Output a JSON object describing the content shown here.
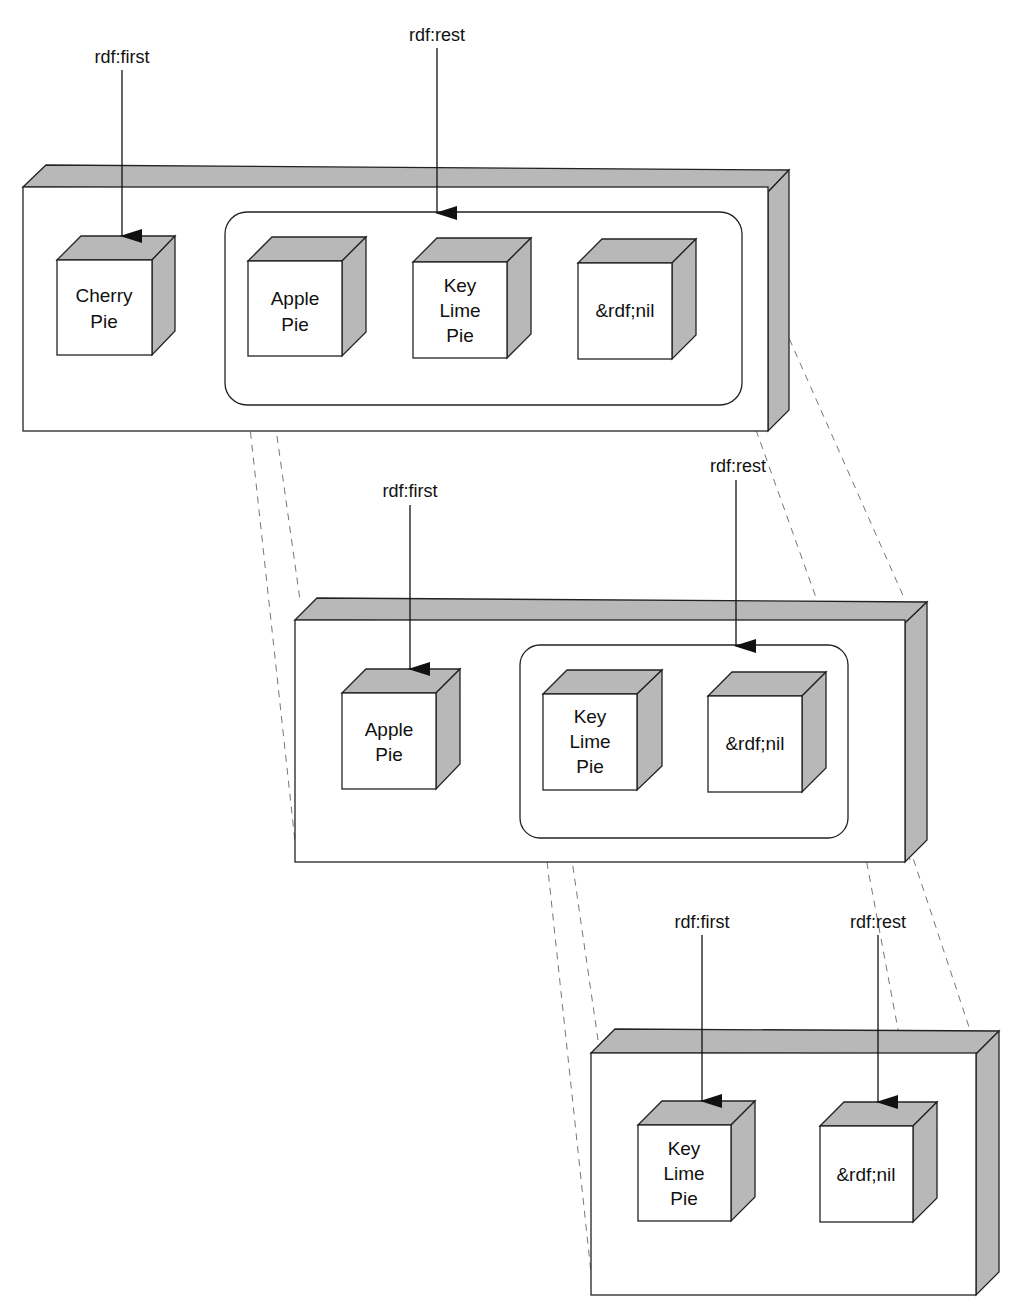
{
  "diagram": {
    "colors": {
      "shade": "#b8b8b8",
      "stroke": "#222222",
      "face": "#ffffff",
      "dashes": "#777777"
    },
    "levels": [
      {
        "first_label": "rdf:first",
        "rest_label": "rdf:rest",
        "first_item": {
          "line1": "Cherry",
          "line2": "Pie",
          "line3": ""
        },
        "rest_items": [
          {
            "line1": "Apple",
            "line2": "Pie",
            "line3": ""
          },
          {
            "line1": "Key",
            "line2": "Lime",
            "line3": "Pie"
          },
          {
            "line1": "&rdf;nil",
            "line2": "",
            "line3": ""
          }
        ]
      },
      {
        "first_label": "rdf:first",
        "rest_label": "rdf:rest",
        "first_item": {
          "line1": "Apple",
          "line2": "Pie",
          "line3": ""
        },
        "rest_items": [
          {
            "line1": "Key",
            "line2": "Lime",
            "line3": "Pie"
          },
          {
            "line1": "&rdf;nil",
            "line2": "",
            "line3": ""
          }
        ]
      },
      {
        "first_label": "rdf:first",
        "rest_label": "rdf:rest",
        "first_item": {
          "line1": "Key",
          "line2": "Lime",
          "line3": "Pie"
        },
        "rest_items": [
          {
            "line1": "&rdf;nil",
            "line2": "",
            "line3": ""
          }
        ]
      }
    ]
  }
}
